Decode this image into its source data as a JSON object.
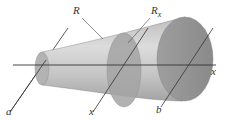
{
  "figure": {
    "labels": {
      "R": "R",
      "Rx_main": "R",
      "Rx_sub": "x",
      "axis": "x",
      "a": "a",
      "x": "x",
      "b": "b"
    },
    "colors": {
      "solid_light": "#c9c9c9",
      "solid_mid": "#a8a8a8",
      "solid_dark": "#8f8f8f",
      "cross_section": "#9a9a9a",
      "line": "#333333"
    }
  }
}
